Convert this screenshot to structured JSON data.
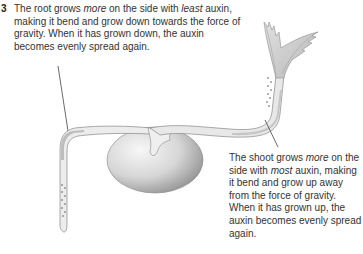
{
  "root_caption": {
    "number": "3",
    "text_1": "The root grows ",
    "em_1": "more",
    "text_2": " on the side with ",
    "em_2": "least",
    "text_3": " auxin, making it bend and grow down towards the force of gravity. When it has grown down, the auxin becomes evenly spread again."
  },
  "shoot_caption": {
    "text_1": "The shoot grows ",
    "em_1": "more",
    "text_2": " on the side with ",
    "em_2": "most",
    "text_3": " auxin, making it bend and grow up away from the force of gravity. When it has grown up, the auxin becomes evenly spread again."
  },
  "diagram": {
    "parts": [
      "seed",
      "root",
      "shoot",
      "leaves",
      "auxin-dots-root",
      "auxin-dots-shoot"
    ],
    "colors": {
      "text": "#333333",
      "stem_fill": "#e6e6e6",
      "stem_shade": "#c4c4c4",
      "seed_light": "#f2f2f2",
      "seed_dark": "#9a9a9a",
      "leaf": "#c8c8c8",
      "leader_line": "#444444"
    }
  }
}
